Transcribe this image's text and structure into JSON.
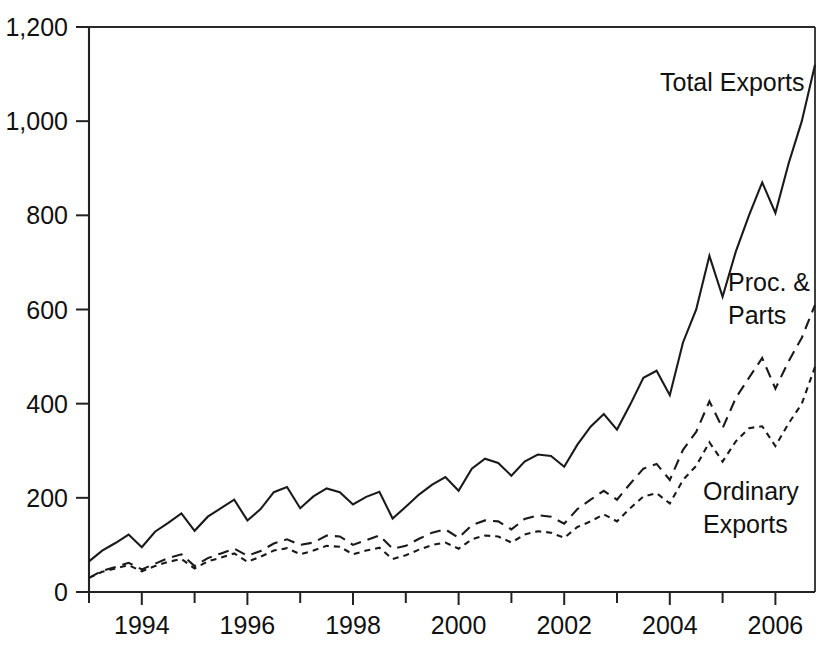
{
  "chart_data": {
    "type": "line",
    "title": "",
    "subtitle": "",
    "xlabel": "",
    "ylabel": "",
    "xlim": [
      1993.0,
      2006.75
    ],
    "ylim": [
      0,
      1200
    ],
    "grid": false,
    "legend_position": "inline-annotations",
    "y_ticks": [
      "0",
      "200",
      "400",
      "600",
      "800",
      "1,000",
      "1,200"
    ],
    "y_tick_values": [
      0,
      200,
      400,
      600,
      800,
      1000,
      1200
    ],
    "x_ticks": [
      "1994",
      "1996",
      "1998",
      "2000",
      "2002",
      "2004",
      "2006"
    ],
    "x_tick_values": [
      1994,
      1996,
      1998,
      2000,
      2002,
      2004,
      2006
    ],
    "x_minor_tick_values": [
      1993,
      1995,
      1997,
      1999,
      2001,
      2003,
      2005
    ],
    "x": [
      1993.0,
      1993.25,
      1993.5,
      1993.75,
      1994.0,
      1994.25,
      1994.5,
      1994.75,
      1995.0,
      1995.25,
      1995.5,
      1995.75,
      1996.0,
      1996.25,
      1996.5,
      1996.75,
      1997.0,
      1997.25,
      1997.5,
      1997.75,
      1998.0,
      1998.25,
      1998.5,
      1998.75,
      1999.0,
      1999.25,
      1999.5,
      1999.75,
      2000.0,
      2000.25,
      2000.5,
      2000.75,
      2001.0,
      2001.25,
      2001.5,
      2001.75,
      2002.0,
      2002.25,
      2002.5,
      2002.75,
      2003.0,
      2003.25,
      2003.5,
      2003.75,
      2004.0,
      2004.25,
      2004.5,
      2004.75,
      2005.0,
      2005.25,
      2005.5,
      2005.75,
      2006.0,
      2006.25,
      2006.5,
      2006.75
    ],
    "series": [
      {
        "name": "Total Exports",
        "style": "solid",
        "values": [
          65,
          88,
          104,
          122,
          95,
          128,
          147,
          167,
          130,
          160,
          178,
          196,
          152,
          176,
          212,
          223,
          178,
          203,
          220,
          212,
          186,
          202,
          213,
          156,
          181,
          207,
          228,
          244,
          215,
          262,
          283,
          274,
          247,
          277,
          292,
          289,
          266,
          313,
          351,
          378,
          345,
          398,
          455,
          470,
          418,
          530,
          600,
          714,
          627,
          723,
          800,
          870,
          805,
          910,
          1000,
          1120
        ]
      },
      {
        "name": "Proc. & Parts",
        "style": "long-dash",
        "values": [
          30,
          45,
          53,
          62,
          48,
          60,
          72,
          80,
          55,
          72,
          82,
          92,
          77,
          87,
          103,
          112,
          100,
          105,
          120,
          118,
          100,
          110,
          120,
          92,
          98,
          113,
          126,
          133,
          115,
          142,
          152,
          150,
          133,
          155,
          163,
          160,
          145,
          176,
          196,
          215,
          196,
          230,
          262,
          272,
          238,
          302,
          340,
          405,
          348,
          412,
          455,
          497,
          432,
          490,
          540,
          610
        ]
      },
      {
        "name": "Ordinary Exports",
        "style": "short-dash",
        "values": [
          30,
          43,
          50,
          57,
          44,
          55,
          64,
          70,
          50,
          65,
          73,
          82,
          64,
          75,
          88,
          93,
          80,
          88,
          98,
          96,
          80,
          88,
          94,
          70,
          78,
          90,
          100,
          105,
          92,
          112,
          120,
          118,
          105,
          122,
          129,
          126,
          115,
          138,
          150,
          165,
          150,
          178,
          203,
          210,
          188,
          238,
          268,
          318,
          277,
          320,
          348,
          352,
          310,
          358,
          400,
          478
        ]
      }
    ],
    "annotations": [
      {
        "text": "Total Exports",
        "series": "Total Exports",
        "x_px": 660,
        "y_px": 91
      },
      {
        "text": "Proc. &",
        "series": "Proc. & Parts",
        "x_px": 728,
        "y_px": 291
      },
      {
        "text": "Parts",
        "series": "Proc. & Parts",
        "x_px": 728,
        "y_px": 324
      },
      {
        "text": "Ordinary",
        "series": "Ordinary Exports",
        "x_px": 703,
        "y_px": 500
      },
      {
        "text": "Exports",
        "series": "Ordinary Exports",
        "x_px": 703,
        "y_px": 533
      }
    ]
  },
  "colors": {
    "background": "#ffffff",
    "ink": "#111111",
    "axis": "#222222"
  }
}
